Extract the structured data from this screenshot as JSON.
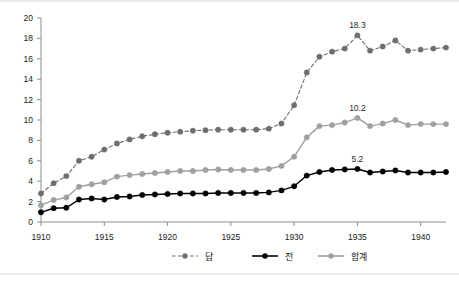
{
  "chart_data": {
    "type": "line",
    "title": "",
    "subtitle": "",
    "xlabel": "",
    "ylabel": "",
    "xlim": [
      1910,
      1942
    ],
    "ylim": [
      0,
      20
    ],
    "grid": false,
    "legend_position": "bottom",
    "x": [
      1910,
      1911,
      1912,
      1913,
      1914,
      1915,
      1916,
      1917,
      1918,
      1919,
      1920,
      1921,
      1922,
      1923,
      1924,
      1925,
      1926,
      1927,
      1928,
      1929,
      1930,
      1931,
      1932,
      1933,
      1934,
      1935,
      1936,
      1937,
      1938,
      1939,
      1940,
      1941,
      1942
    ],
    "x_ticks": [
      1910,
      1915,
      1920,
      1925,
      1930,
      1935,
      1940
    ],
    "x_tick_labels": [
      "1910",
      "1915",
      "1920",
      "1925",
      "1930",
      "1935",
      "1940"
    ],
    "y_ticks": [
      0,
      2,
      4,
      6,
      8,
      10,
      12,
      14,
      16,
      18,
      20
    ],
    "y_tick_labels": [
      "0",
      "2",
      "4",
      "6",
      "8",
      "10",
      "12",
      "14",
      "16",
      "18",
      "20"
    ],
    "series": [
      {
        "name": "답",
        "color": "#6e6e6e",
        "line_style": "dashed",
        "marker": "circle",
        "values": [
          2.8,
          3.8,
          4.5,
          6.0,
          6.4,
          7.1,
          7.7,
          8.1,
          8.4,
          8.6,
          8.75,
          8.85,
          8.95,
          9.0,
          9.05,
          9.05,
          9.05,
          9.05,
          9.15,
          9.65,
          11.45,
          14.65,
          16.2,
          16.7,
          17.0,
          18.3,
          16.8,
          17.2,
          17.8,
          16.8,
          16.9,
          17.0,
          17.1
        ]
      },
      {
        "name": "전",
        "color": "#000000",
        "line_style": "solid",
        "marker": "circle",
        "values": [
          0.95,
          1.35,
          1.4,
          2.2,
          2.3,
          2.2,
          2.45,
          2.5,
          2.65,
          2.7,
          2.75,
          2.8,
          2.8,
          2.8,
          2.85,
          2.85,
          2.85,
          2.85,
          2.9,
          3.1,
          3.5,
          4.55,
          4.9,
          5.1,
          5.15,
          5.2,
          4.85,
          4.95,
          5.05,
          4.85,
          4.85,
          4.85,
          4.9
        ]
      },
      {
        "name": "합계",
        "color": "#a0a0a0",
        "line_style": "solid",
        "marker": "circle",
        "values": [
          1.65,
          2.15,
          2.4,
          3.45,
          3.7,
          3.9,
          4.45,
          4.6,
          4.7,
          4.8,
          4.9,
          5.0,
          5.0,
          5.1,
          5.15,
          5.1,
          5.1,
          5.1,
          5.2,
          5.5,
          6.4,
          8.3,
          9.4,
          9.5,
          9.75,
          10.2,
          9.4,
          9.65,
          10.0,
          9.5,
          9.6,
          9.6,
          9.6
        ]
      }
    ],
    "annotations": [
      {
        "text": "18.3",
        "x": 1935,
        "y": 18.3,
        "series": "답"
      },
      {
        "text": "10.2",
        "x": 1935,
        "y": 10.2,
        "series": "합계"
      },
      {
        "text": "5.2",
        "x": 1935,
        "y": 5.2,
        "series": "전"
      }
    ]
  },
  "legend": {
    "items": [
      {
        "label": "답"
      },
      {
        "label": "전"
      },
      {
        "label": "합계"
      }
    ]
  }
}
